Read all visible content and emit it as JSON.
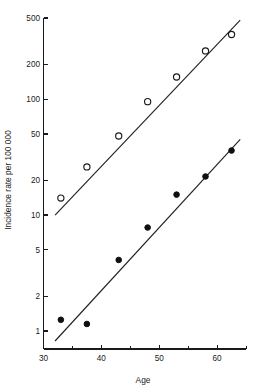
{
  "chart_data": {
    "type": "scatter",
    "title": "",
    "subtitle": "",
    "xlabel": "Age",
    "ylabel": "Incidence rate per 100 000",
    "xscale": "linear",
    "yscale": "log",
    "xlim": [
      30,
      65
    ],
    "ylim": [
      0.8,
      560
    ],
    "grid": false,
    "legend": "none",
    "x_ticks_labeled": [
      30,
      40,
      50,
      60
    ],
    "x_ticks_minor": [
      35,
      45,
      55,
      65
    ],
    "x_tick_labels": [
      "30",
      "40",
      "50",
      "60"
    ],
    "y_ticks": [
      1,
      2,
      5,
      10,
      20,
      50,
      100,
      200,
      500
    ],
    "y_tick_labels": [
      "1",
      "2",
      "5",
      "10",
      "20",
      "50",
      "100",
      "200",
      "500"
    ],
    "series": [
      {
        "name": "open-circles",
        "marker": "open-circle",
        "color": "#1a1a1a",
        "x": [
          33,
          37.5,
          43,
          48,
          53,
          58,
          62.5
        ],
        "y": [
          14,
          26,
          48,
          95,
          155,
          260,
          360
        ],
        "fit_line": {
          "x_start": 32,
          "y_start": 10,
          "x_end": 64,
          "y_end": 480
        }
      },
      {
        "name": "filled-circles",
        "marker": "filled-circle",
        "color": "#101010",
        "x": [
          33,
          37.5,
          43,
          48,
          53,
          58,
          62.5
        ],
        "y": [
          1.25,
          1.15,
          4.1,
          7.8,
          15,
          21.5,
          36
        ],
        "fit_line": {
          "x_start": 32,
          "y_start": 0.82,
          "x_end": 64,
          "y_end": 45
        }
      }
    ],
    "annotations": []
  }
}
